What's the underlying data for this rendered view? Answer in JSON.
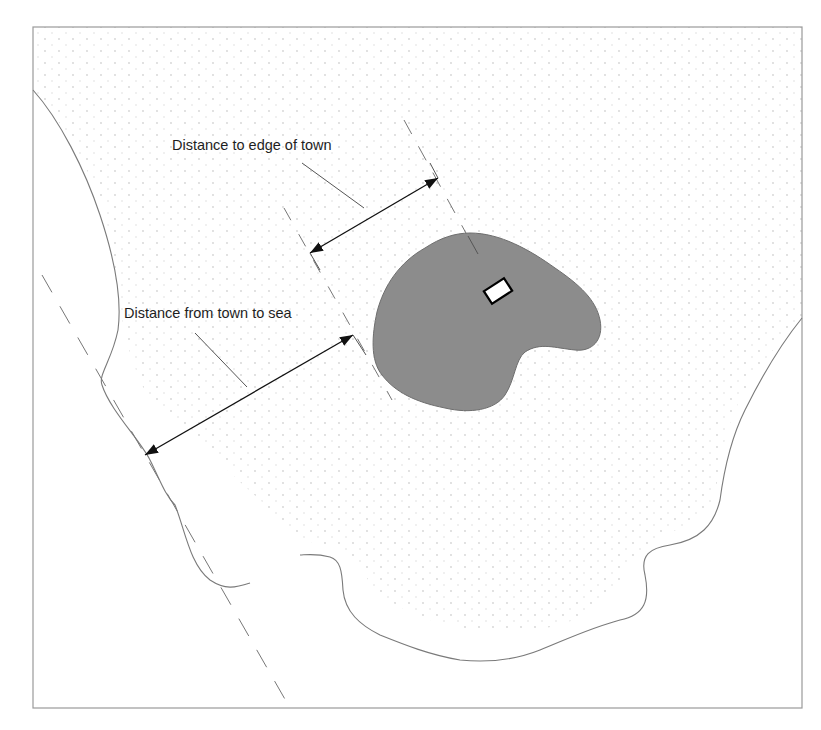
{
  "diagram": {
    "type": "annotated-map-sketch",
    "labels": {
      "edge_of_town": "Distance to edge of town",
      "town_to_sea": "Distance from town to sea"
    },
    "colors": {
      "background": "#ffffff",
      "frame": "#9a9a9a",
      "coastline": "#7a7a7a",
      "town_fill": "#8c8c8c",
      "town_stroke": "#6e6e6e",
      "site_fill": "#ffffff",
      "site_stroke": "#000000",
      "arrow": "#111111",
      "dashed_line": "#777777",
      "leader_line": "#555555",
      "text": "#1e1e1e",
      "stipple": "#d8d8d8"
    },
    "elements": [
      {
        "id": "frame",
        "kind": "rectangle",
        "x": 33,
        "y": 27,
        "w": 769,
        "h": 681
      },
      {
        "id": "town",
        "kind": "area",
        "description": "grey town area"
      },
      {
        "id": "site",
        "kind": "rotated-rectangle",
        "description": "white site marker inside town",
        "cx": 498,
        "cy": 291
      },
      {
        "id": "coastline-west",
        "kind": "curve",
        "description": "coastline on the left"
      },
      {
        "id": "coastline-south-east",
        "kind": "curve",
        "description": "coastline from right edge around bottom"
      },
      {
        "id": "arrow-edge-of-town",
        "kind": "double-arrow",
        "from": [
          310,
          253
        ],
        "to": [
          438,
          178
        ]
      },
      {
        "id": "arrow-town-to-sea",
        "kind": "double-arrow",
        "from": [
          145,
          455
        ],
        "to": [
          353,
          335
        ]
      }
    ]
  }
}
